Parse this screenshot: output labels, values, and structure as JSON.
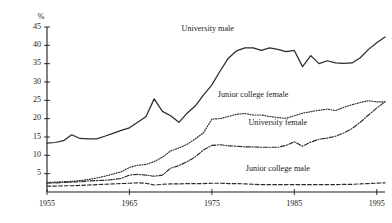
{
  "chart_data": {
    "type": "line",
    "title": "",
    "subtitle": "",
    "xlabel": "",
    "ylabel": "%",
    "unit_label": "%",
    "xlim": [
      1955,
      1996
    ],
    "ylim": [
      0,
      45
    ],
    "grid": false,
    "legend_position": "inline-annotations",
    "x_ticks": [
      1955,
      1965,
      1975,
      1985,
      1995
    ],
    "x_tick_labels": [
      "1955",
      "1965",
      "1975",
      "1985",
      "1995"
    ],
    "y_ticks": [
      5,
      10,
      15,
      20,
      25,
      30,
      35,
      40,
      45
    ],
    "y_tick_labels": [
      "5",
      "10",
      "15",
      "20",
      "25",
      "30",
      "35",
      "40",
      "45"
    ],
    "x": [
      1955,
      1956,
      1957,
      1958,
      1959,
      1960,
      1961,
      1962,
      1963,
      1964,
      1965,
      1966,
      1967,
      1968,
      1969,
      1970,
      1971,
      1972,
      1973,
      1974,
      1975,
      1976,
      1977,
      1978,
      1979,
      1980,
      1981,
      1982,
      1983,
      1984,
      1985,
      1986,
      1987,
      1988,
      1989,
      1990,
      1991,
      1992,
      1993,
      1994,
      1995,
      1996
    ],
    "series": [
      {
        "name": "University male",
        "style": "solid",
        "color": "#2b2b2b",
        "label_x": 1974.5,
        "label_y": 44.0,
        "values": [
          13.3,
          13.5,
          14.0,
          15.6,
          14.6,
          14.5,
          14.5,
          15.2,
          16.0,
          16.8,
          17.5,
          19.0,
          20.5,
          25.4,
          22.0,
          20.8,
          19.0,
          21.5,
          23.5,
          26.5,
          29.2,
          33.0,
          36.5,
          38.5,
          39.3,
          39.3,
          38.6,
          39.3,
          38.9,
          38.3,
          38.6,
          34.2,
          37.2,
          35.0,
          35.8,
          35.2,
          35.1,
          35.2,
          36.6,
          38.9,
          40.7,
          42.3
        ]
      },
      {
        "name": "Junior college female",
        "style": "dotted",
        "color": "#2b2b2b",
        "label_x": 1980.0,
        "label_y": 25.8,
        "values": [
          2.6,
          2.7,
          2.8,
          2.9,
          3.1,
          3.4,
          3.8,
          4.3,
          4.9,
          5.5,
          6.7,
          7.3,
          7.5,
          8.3,
          9.5,
          11.2,
          12.0,
          13.0,
          14.5,
          16.2,
          19.9,
          20.0,
          20.6,
          21.2,
          21.4,
          21.0,
          21.0,
          20.6,
          20.3,
          20.1,
          20.8,
          21.5,
          21.9,
          22.3,
          22.6,
          22.2,
          23.1,
          23.8,
          24.4,
          24.9,
          24.6,
          24.6
        ]
      },
      {
        "name": "University female",
        "style": "dashdot",
        "color": "#2b2b2b",
        "label_x": 1983.0,
        "label_y": 18.3,
        "values": [
          2.4,
          2.5,
          2.6,
          2.7,
          2.8,
          3.0,
          3.1,
          3.2,
          3.4,
          3.7,
          4.6,
          4.8,
          4.6,
          4.3,
          4.6,
          6.5,
          7.2,
          8.3,
          9.6,
          11.5,
          12.7,
          12.9,
          12.6,
          12.5,
          12.3,
          12.3,
          12.2,
          12.2,
          12.2,
          12.7,
          13.7,
          12.5,
          13.6,
          14.4,
          14.7,
          15.2,
          16.1,
          17.3,
          19.0,
          21.0,
          22.9,
          24.6
        ]
      },
      {
        "name": "Junior college male",
        "style": "dashed",
        "color": "#2b2b2b",
        "label_x": 1983.0,
        "label_y": 5.7,
        "values": [
          1.6,
          1.6,
          1.7,
          1.7,
          1.8,
          1.9,
          2.0,
          2.1,
          2.2,
          2.3,
          2.4,
          2.5,
          2.4,
          1.9,
          2.1,
          2.2,
          2.2,
          2.3,
          2.3,
          2.3,
          2.4,
          2.4,
          2.3,
          2.3,
          2.2,
          2.1,
          2.0,
          2.0,
          2.0,
          2.0,
          2.0,
          2.0,
          2.0,
          2.0,
          2.0,
          2.0,
          2.1,
          2.1,
          2.2,
          2.3,
          2.4,
          2.5
        ]
      }
    ]
  }
}
